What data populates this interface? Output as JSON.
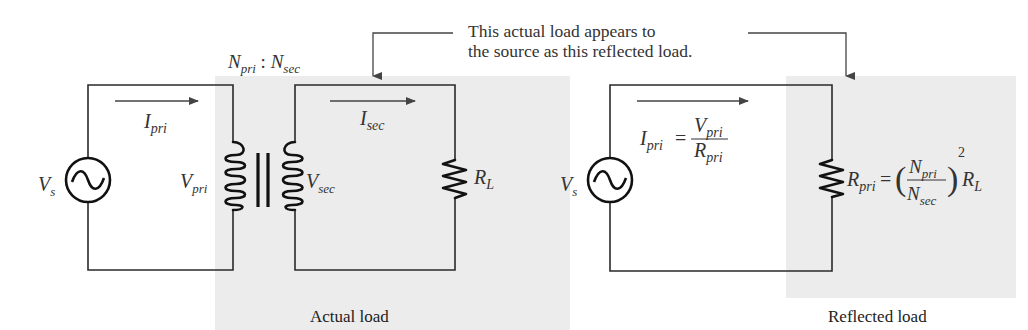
{
  "colors": {
    "background": "#ffffff",
    "shaded_region": "#ececec",
    "wire": "#2a2a2a",
    "text": "#333333"
  },
  "annotation": {
    "line1": "This actual load appears to",
    "line2": "the source as this reflected load."
  },
  "left_circuit": {
    "turns_ratio": {
      "n_pri": "N",
      "n_pri_sub": "pri",
      "sep": " : ",
      "n_sec": "N",
      "n_sec_sub": "sec"
    },
    "source": {
      "label": "V",
      "sub": "s",
      "icon": "ac-source-icon"
    },
    "primary_current": {
      "label": "I",
      "sub": "pri"
    },
    "primary_voltage": {
      "label": "V",
      "sub": "pri"
    },
    "secondary_voltage": {
      "label": "V",
      "sub": "sec"
    },
    "secondary_current": {
      "label": "I",
      "sub": "sec"
    },
    "load": {
      "label": "R",
      "sub": "L",
      "icon": "resistor-icon"
    },
    "transformer_icon": "iron-core-transformer-icon",
    "caption": "Actual load"
  },
  "right_circuit": {
    "source": {
      "label": "V",
      "sub": "s",
      "icon": "ac-source-icon"
    },
    "current_formula": {
      "lhs": "I",
      "lhs_sub": "pri",
      "eq": "=",
      "num": "V",
      "num_sub": "pri",
      "den": "R",
      "den_sub": "pri"
    },
    "resistance_formula": {
      "lhs": "R",
      "lhs_sub": "pri",
      "eq": "=",
      "num": "N",
      "num_sub": "pri",
      "den": "N",
      "den_sub": "sec",
      "exp": "2",
      "tail": "R",
      "tail_sub": "L"
    },
    "caption": "Reflected load"
  }
}
